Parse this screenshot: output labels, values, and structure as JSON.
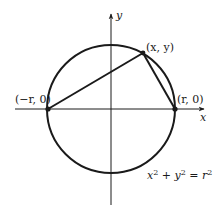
{
  "diagram": {
    "type": "geometry",
    "colors": {
      "stroke": "#1a1a1a",
      "background": "#ffffff"
    },
    "axes": {
      "x_label": "x",
      "y_label": "y"
    },
    "points": [
      {
        "id": "left",
        "label": "(−r, 0)"
      },
      {
        "id": "right",
        "label": "(r, 0)"
      },
      {
        "id": "top",
        "label": "(x, y)"
      }
    ],
    "equation": {
      "x_base": "x",
      "x_exp": "2",
      "plus": " + ",
      "y_base": "y",
      "y_exp": "2",
      "equals": " = ",
      "r_base": "r",
      "r_exp": "2"
    },
    "geometry": {
      "center": [
        111,
        109
      ],
      "radius": 64,
      "point_left": [
        48,
        109
      ],
      "point_right": [
        175,
        109
      ],
      "point_top": [
        143,
        53
      ]
    }
  }
}
